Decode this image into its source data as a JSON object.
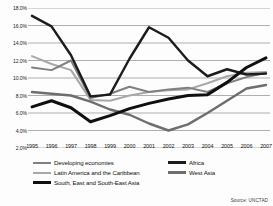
{
  "figure": {
    "title_partial": "",
    "source_note": "Source: UNCTAD"
  },
  "axes": {
    "y_ticks": [
      "18.0%",
      "16.0%",
      "14.0%",
      "12.0%",
      "10.0%",
      "8.0%",
      "6.0%",
      "4.0%",
      "2.0%"
    ],
    "x_ticks": [
      "1995",
      "1996",
      "1997",
      "1998",
      "1999",
      "2000",
      "2001",
      "2002",
      "2003",
      "2004",
      "2005",
      "2006",
      "2007"
    ]
  },
  "legend": {
    "left_items": [
      {
        "label": "Developing economies",
        "color": "#808080",
        "weight": "2.0px"
      },
      {
        "label": "Latin America and the Caribbean",
        "color": "#a8a8a8",
        "weight": "2.0px"
      },
      {
        "label": "South, East and South-East Asia",
        "color": "#101010",
        "weight": "3.0px"
      }
    ],
    "right_items": [
      {
        "label": "Africa",
        "color": "#1c1c1c",
        "weight": "2.4px"
      },
      {
        "label": "West Asia",
        "color": "#6e6e6e",
        "weight": "2.4px"
      }
    ]
  },
  "chart_data": {
    "type": "line",
    "title": "",
    "xlabel": "",
    "ylabel": "",
    "ylim": [
      2.0,
      18.0
    ],
    "y_unit": "%",
    "grid": true,
    "legend_position": "bottom",
    "x": [
      1995,
      1996,
      1997,
      1998,
      1999,
      2000,
      2001,
      2002,
      2003,
      2004,
      2005,
      2006,
      2007
    ],
    "series": [
      {
        "name": "Africa",
        "color": "#1c1c1c",
        "width": 2.4,
        "values": [
          17.1,
          15.9,
          12.6,
          7.9,
          8.1,
          12.2,
          15.8,
          14.6,
          12.0,
          10.2,
          11.0,
          10.4,
          10.5
        ]
      },
      {
        "name": "Latin America and the Caribbean",
        "color": "#a8a8a8",
        "width": 2.0,
        "values": [
          12.5,
          11.6,
          10.9,
          7.5,
          7.4,
          8.0,
          8.4,
          8.6,
          8.7,
          9.4,
          10.2,
          10.6,
          10.7
        ]
      },
      {
        "name": "Developing economies",
        "color": "#808080",
        "width": 2.0,
        "values": [
          11.2,
          10.9,
          12.0,
          7.7,
          8.2,
          9.0,
          8.4,
          8.7,
          8.9,
          8.4,
          9.4,
          10.1,
          10.6
        ]
      },
      {
        "name": "West Asia",
        "color": "#6e6e6e",
        "width": 2.4,
        "values": [
          8.4,
          8.2,
          8.0,
          7.3,
          6.4,
          5.8,
          4.8,
          4.0,
          4.7,
          6.0,
          7.4,
          8.8,
          9.2
        ]
      },
      {
        "name": "South, East and South-East Asia",
        "color": "#101010",
        "width": 3.0,
        "values": [
          6.7,
          7.4,
          6.6,
          5.0,
          5.7,
          6.5,
          7.1,
          7.6,
          8.0,
          8.1,
          9.5,
          11.2,
          12.3
        ]
      }
    ]
  }
}
